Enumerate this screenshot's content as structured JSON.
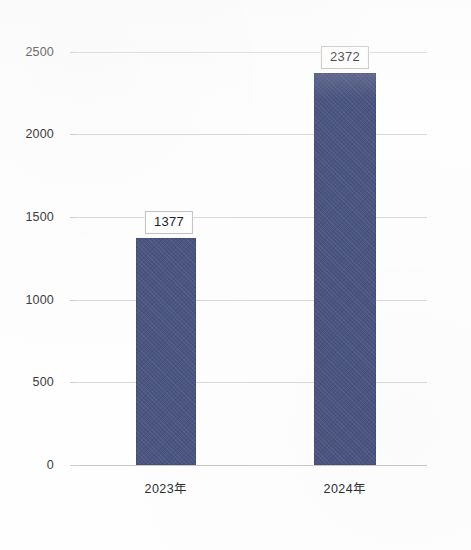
{
  "chart_data": {
    "type": "bar",
    "title": "",
    "subtitle": "",
    "xlabel": "",
    "ylabel": "",
    "categories": [
      "2023年",
      "2024年"
    ],
    "values": [
      1377,
      2372
    ],
    "data_labels": [
      "1377",
      "2372"
    ],
    "series": [
      {
        "name": "",
        "values": [
          1377,
          2372
        ]
      }
    ],
    "ylim": [
      0,
      2500
    ],
    "y_ticks": [
      0,
      500,
      1000,
      1500,
      2000,
      2500
    ],
    "y_tick_labels": [
      "0",
      "500",
      "1000",
      "1500",
      "2000",
      "2500"
    ],
    "grid": true,
    "grid_axis": "y",
    "legend": false,
    "legend_position": "none",
    "bar_color": "#4a5580",
    "gridline_color": "#d9d9d9",
    "axis_text_color": "#3d3d3d",
    "label_box_border_color": "#c2c2c2",
    "background_color": "#ffffff"
  }
}
